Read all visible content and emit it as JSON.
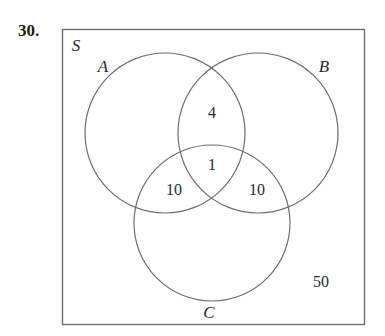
{
  "problem": {
    "number": "30."
  },
  "diagram": {
    "type": "venn-diagram-3-set",
    "universe_label": "S",
    "stroke_color": "#6e6e6e",
    "text_color": "#2a2a2a",
    "background_color": "#ffffff",
    "sets": [
      {
        "id": "A",
        "label": "A",
        "label_x": 103,
        "label_y": 72,
        "cx": 165,
        "cy": 133,
        "r": 80
      },
      {
        "id": "B",
        "label": "B",
        "label_x": 322,
        "label_y": 72,
        "cx": 258,
        "cy": 133,
        "r": 80
      },
      {
        "id": "C",
        "label": "C",
        "label_x": 207,
        "label_y": 318,
        "cx": 212,
        "cy": 223,
        "r": 78
      }
    ],
    "universe_box": {
      "x": 62,
      "y": 29,
      "width": 303,
      "height": 296
    },
    "universe_label_x": 75,
    "universe_label_y": 51,
    "regions": [
      {
        "name": "A-and-B-only",
        "value": "4",
        "x": 212,
        "y": 118
      },
      {
        "name": "A-and-B-and-C",
        "value": "1",
        "x": 212,
        "y": 170
      },
      {
        "name": "A-and-C-only",
        "value": "10",
        "x": 174,
        "y": 195
      },
      {
        "name": "B-and-C-only",
        "value": "10",
        "x": 257,
        "y": 195
      },
      {
        "name": "outside-all-sets",
        "value": "50",
        "x": 321,
        "y": 287
      }
    ]
  }
}
